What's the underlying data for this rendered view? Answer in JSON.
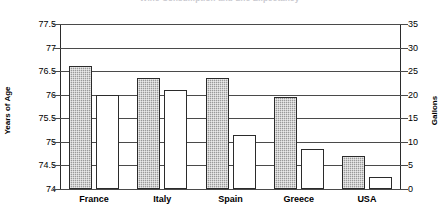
{
  "chart_data": {
    "type": "bar",
    "title": "Wine Consumption and Life Expectancy",
    "categories": [
      "France",
      "Italy",
      "Spain",
      "Greece",
      "USA"
    ],
    "series": [
      {
        "name": "Years of Age",
        "axis": "left",
        "style": "shaded",
        "values": [
          76.6,
          76.35,
          76.35,
          75.95,
          74.7
        ]
      },
      {
        "name": "Gallons",
        "axis": "right",
        "style": "white",
        "values": [
          20,
          21,
          11.5,
          8.5,
          2.5
        ]
      }
    ],
    "left_axis": {
      "label": "Years of Age",
      "min": 74,
      "max": 77.5,
      "step": 0.5,
      "ticks": [
        "77.5",
        "77",
        "76.5",
        "76",
        "75.5",
        "75",
        "74.5",
        "74"
      ]
    },
    "right_axis": {
      "label": "Gallons",
      "min": 0,
      "max": 35,
      "step": 5,
      "ticks": [
        "35",
        "30",
        "25",
        "20",
        "15",
        "10",
        "5",
        "0"
      ]
    },
    "xlabel": "",
    "grid": true,
    "legend": "none"
  },
  "colors": {
    "axis": "#2b2b2b",
    "gridline": "#4a4a4a",
    "bar_age_fill": "#9a9a9a",
    "bar_gallons_fill": "#ffffff",
    "background": "#ffffff"
  }
}
